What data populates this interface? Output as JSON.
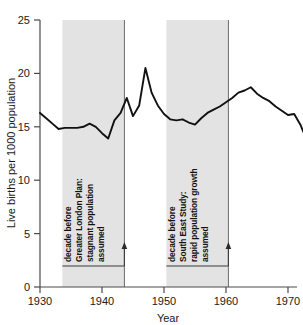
{
  "chart_data": {
    "type": "line",
    "title": "",
    "xlabel": "Year",
    "ylabel": "Live births per 1000 population",
    "xlim": [
      1930,
      1975
    ],
    "ylim": [
      0,
      25
    ],
    "xticks": [
      1930,
      1940,
      1950,
      1960,
      1970
    ],
    "yticks": [
      0,
      5,
      10,
      15,
      20,
      25
    ],
    "grid": false,
    "legend": null,
    "series": [
      {
        "name": "Live births per 1000 population",
        "x": [
          1930,
          1931,
          1932,
          1933,
          1934,
          1935,
          1936,
          1937,
          1938,
          1939,
          1940,
          1941,
          1942,
          1943,
          1944,
          1945,
          1946,
          1947,
          1948,
          1949,
          1950,
          1951,
          1952,
          1953,
          1954,
          1955,
          1956,
          1957,
          1958,
          1959,
          1960,
          1961,
          1962,
          1963,
          1964,
          1965,
          1966,
          1967,
          1968,
          1969,
          1970,
          1971,
          1972,
          1973,
          1974
        ],
        "values": [
          16.3,
          15.8,
          15.3,
          14.8,
          14.9,
          14.9,
          14.9,
          15.0,
          15.3,
          15.0,
          14.4,
          13.9,
          15.6,
          16.3,
          17.7,
          16.0,
          17.0,
          20.5,
          18.2,
          17.0,
          16.2,
          15.7,
          15.6,
          15.7,
          15.4,
          15.2,
          15.8,
          16.3,
          16.6,
          16.9,
          17.3,
          17.7,
          18.2,
          18.4,
          18.7,
          18.1,
          17.7,
          17.4,
          16.9,
          16.5,
          16.1,
          16.2,
          15.2,
          13.8,
          12.1
        ]
      }
    ],
    "shaded_bands": [
      {
        "id": "greater-london-plan",
        "x_start": 1934,
        "x_end": 1944,
        "label_lines": [
          "decade before",
          "Greater London Plan:",
          "stagnant population",
          "assumed"
        ],
        "arrow_at": 1944,
        "color": "#d8d8d8"
      },
      {
        "id": "south-east-study",
        "x_start": 1954,
        "x_end": 1964,
        "label_lines": [
          "decade before",
          "South East Study:",
          "rapid population growth",
          "assumed"
        ],
        "arrow_at": 1964,
        "color": "#d8d8d8"
      }
    ]
  },
  "axes": {
    "y_title": "Live births per 1000 population",
    "x_title": "Year",
    "y_tick_labels": [
      "0",
      "5",
      "10",
      "15",
      "20",
      "25"
    ],
    "x_tick_labels": [
      "1930",
      "1940",
      "1950",
      "1960",
      "1970"
    ]
  },
  "annotations": {
    "band_1": {
      "line_1": "decade before",
      "line_2": "Greater London Plan:",
      "line_3": "stagnant population",
      "line_4": "assumed"
    },
    "band_2": {
      "line_1": "decade before",
      "line_2": "South East Study:",
      "line_3": "rapid population growth",
      "line_4": "assumed"
    }
  },
  "colors": {
    "line": "#111111",
    "band": "#d8d8d8",
    "axis": "#4a4a4a",
    "background": "#ffffff"
  }
}
